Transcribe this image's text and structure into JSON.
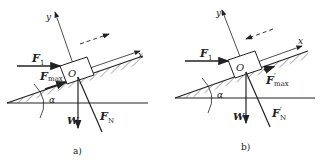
{
  "panels": [
    {
      "caption": "a)",
      "origin": "O",
      "axis_x": "x",
      "axis_y": "y",
      "force_applied": {
        "symbol": "F",
        "sub": "1"
      },
      "force_friction": {
        "symbol": "F",
        "sub": "max",
        "prime": ""
      },
      "force_normal": {
        "symbol": "F",
        "sub": "N",
        "prime": ""
      },
      "weight": "W",
      "angle": "α",
      "motion_direction": "up-slope"
    },
    {
      "caption": "b)",
      "origin": "O",
      "axis_x": "x",
      "axis_y": "y",
      "force_applied": {
        "symbol": "F",
        "sub": "1"
      },
      "force_friction": {
        "symbol": "F",
        "sub": "max",
        "prime": "′"
      },
      "force_normal": {
        "symbol": "F",
        "sub": "N",
        "prime": "′"
      },
      "weight": "W",
      "angle": "α",
      "motion_direction": "down-slope"
    }
  ],
  "colors": {
    "ink": "#222222",
    "background": "#ffffff"
  }
}
